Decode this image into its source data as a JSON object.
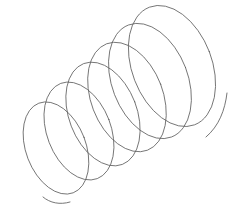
{
  "image": {
    "title": "Coil spring wire drawing",
    "subject": "helix-coil-spring",
    "style": "line-art-sketch",
    "background_color": "#ffffff",
    "line_color": "#5d5d5d",
    "line_width_px": 0.85,
    "width_px": 237,
    "height_px": 218
  },
  "chart_data": {
    "type": "line",
    "xlabel": "",
    "ylabel": "",
    "xlim": [
      0,
      237
    ],
    "ylim": [
      0,
      218
    ],
    "grid": false,
    "legend": null,
    "geometry": {
      "turn_count": 6,
      "axis_start_xy": [
        62,
        150
      ],
      "axis_end_xy": [
        170,
        66
      ],
      "ellipse_tilt_deg": -21,
      "ellipse_rx_first": 30,
      "ellipse_ry_first": 48,
      "ellipse_rx_last": 41,
      "ellipse_ry_last": 64,
      "bounds": {
        "left": 14,
        "top": 9,
        "right": 227,
        "bottom": 206
      }
    },
    "series": [
      {
        "name": "turn-1",
        "center": [
          56,
          148
        ],
        "rx": 30,
        "ry": 48,
        "rotation_deg": -21
      },
      {
        "name": "turn-2",
        "center": [
          79,
          131
        ],
        "rx": 32,
        "ry": 51,
        "rotation_deg": -21
      },
      {
        "name": "turn-3",
        "center": [
          103,
          114
        ],
        "rx": 34,
        "ry": 54,
        "rotation_deg": -21
      },
      {
        "name": "turn-4",
        "center": [
          127,
          97
        ],
        "rx": 36,
        "ry": 57,
        "rotation_deg": -21
      },
      {
        "name": "turn-5",
        "center": [
          150,
          81
        ],
        "rx": 38,
        "ry": 60,
        "rotation_deg": -21
      },
      {
        "name": "turn-6",
        "center": [
          172,
          66
        ],
        "rx": 40,
        "ry": 63,
        "rotation_deg": -21
      }
    ],
    "tails": [
      {
        "name": "tail-bottom-left",
        "path": "M 43 197 C 50 203 60 205 70 202",
        "end_xy": [
          70,
          202
        ]
      },
      {
        "name": "tail-right",
        "path": "M 227 93 C 225 110 219 126 206 137",
        "end_xy": [
          227,
          93
        ]
      }
    ]
  }
}
